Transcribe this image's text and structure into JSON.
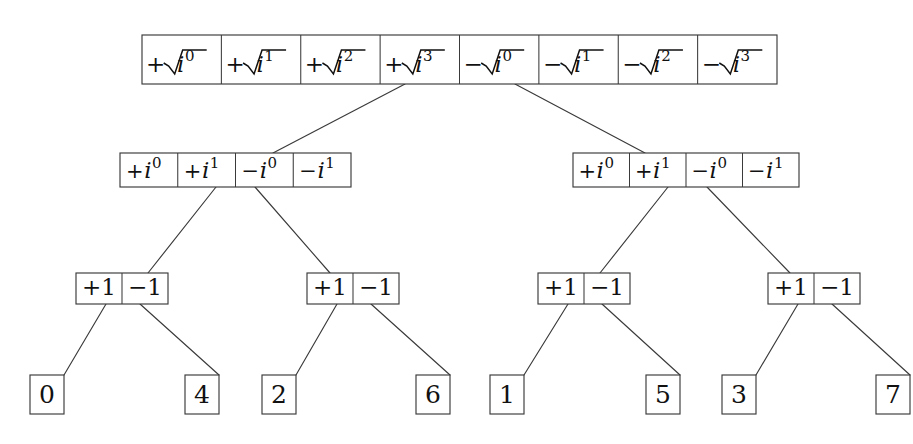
{
  "diagram": {
    "background_color": "#ffffff",
    "line_color": "#3a3a3a",
    "text_color": "#111111",
    "levels": [
      {
        "level": 0,
        "name": "root-row",
        "box": {
          "x": 142,
          "y": 35,
          "width": 635,
          "height": 49
        },
        "cells": [
          {
            "sign": "+",
            "radical": true,
            "base": "i",
            "exponent": "0",
            "label": "+√i⁰"
          },
          {
            "sign": "+",
            "radical": true,
            "base": "i",
            "exponent": "1",
            "label": "+√i¹"
          },
          {
            "sign": "+",
            "radical": true,
            "base": "i",
            "exponent": "2",
            "label": "+√i²"
          },
          {
            "sign": "+",
            "radical": true,
            "base": "i",
            "exponent": "3",
            "label": "+√i³"
          },
          {
            "sign": "−",
            "radical": true,
            "base": "i",
            "exponent": "0",
            "label": "−√i⁰"
          },
          {
            "sign": "−",
            "radical": true,
            "base": "i",
            "exponent": "1",
            "label": "−√i¹"
          },
          {
            "sign": "−",
            "radical": true,
            "base": "i",
            "exponent": "2",
            "label": "−√i²"
          },
          {
            "sign": "−",
            "radical": true,
            "base": "i",
            "exponent": "3",
            "label": "−√i³"
          }
        ]
      },
      {
        "level": 1,
        "name": "second-row",
        "boxes": [
          {
            "id": "left",
            "box": {
              "x": 120,
              "y": 153,
              "width": 231,
              "height": 34
            },
            "cells": [
              {
                "sign": "+",
                "radical": false,
                "base": "i",
                "exponent": "0",
                "label": "+i⁰"
              },
              {
                "sign": "+",
                "radical": false,
                "base": "i",
                "exponent": "1",
                "label": "+i¹"
              },
              {
                "sign": "−",
                "radical": false,
                "base": "i",
                "exponent": "0",
                "label": "−i⁰"
              },
              {
                "sign": "−",
                "radical": false,
                "base": "i",
                "exponent": "1",
                "label": "−i¹"
              }
            ]
          },
          {
            "id": "right",
            "box": {
              "x": 573,
              "y": 153,
              "width": 226,
              "height": 34
            },
            "cells": [
              {
                "sign": "+",
                "radical": false,
                "base": "i",
                "exponent": "0",
                "label": "+i⁰"
              },
              {
                "sign": "+",
                "radical": false,
                "base": "i",
                "exponent": "1",
                "label": "+i¹"
              },
              {
                "sign": "−",
                "radical": false,
                "base": "i",
                "exponent": "0",
                "label": "−i⁰"
              },
              {
                "sign": "−",
                "radical": false,
                "base": "i",
                "exponent": "1",
                "label": "−i¹"
              }
            ]
          }
        ]
      },
      {
        "level": 2,
        "name": "third-row",
        "boxes": [
          {
            "id": "a",
            "box": {
              "x": 76,
              "y": 273,
              "width": 92,
              "height": 31
            },
            "cells": [
              {
                "label": "+1"
              },
              {
                "label": "−1"
              }
            ]
          },
          {
            "id": "b",
            "box": {
              "x": 307,
              "y": 273,
              "width": 92,
              "height": 31
            },
            "cells": [
              {
                "label": "+1"
              },
              {
                "label": "−1"
              }
            ]
          },
          {
            "id": "c",
            "box": {
              "x": 538,
              "y": 273,
              "width": 92,
              "height": 31
            },
            "cells": [
              {
                "label": "+1"
              },
              {
                "label": "−1"
              }
            ]
          },
          {
            "id": "d",
            "box": {
              "x": 768,
              "y": 273,
              "width": 92,
              "height": 31
            },
            "cells": [
              {
                "label": "+1"
              },
              {
                "label": "−1"
              }
            ]
          }
        ]
      },
      {
        "level": 3,
        "name": "leaf-row",
        "leaves": [
          {
            "label": "0",
            "box": {
              "x": 30,
              "y": 375,
              "width": 34,
              "height": 39
            }
          },
          {
            "label": "4",
            "box": {
              "x": 185,
              "y": 375,
              "width": 34,
              "height": 39
            }
          },
          {
            "label": "2",
            "box": {
              "x": 262,
              "y": 375,
              "width": 34,
              "height": 39
            }
          },
          {
            "label": "6",
            "box": {
              "x": 416,
              "y": 375,
              "width": 34,
              "height": 39
            }
          },
          {
            "label": "1",
            "box": {
              "x": 490,
              "y": 375,
              "width": 34,
              "height": 39
            }
          },
          {
            "label": "5",
            "box": {
              "x": 646,
              "y": 375,
              "width": 34,
              "height": 39
            }
          },
          {
            "label": "3",
            "box": {
              "x": 722,
              "y": 375,
              "width": 34,
              "height": 39
            }
          },
          {
            "label": "7",
            "box": {
              "x": 876,
              "y": 375,
              "width": 34,
              "height": 39
            }
          }
        ]
      }
    ],
    "edges": [
      {
        "from": "root",
        "to": "second-left",
        "x1": 405,
        "y1": 84,
        "x2": 273,
        "y2": 153
      },
      {
        "from": "root",
        "to": "second-right",
        "x1": 515,
        "y1": 84,
        "x2": 645,
        "y2": 153
      },
      {
        "from": "second-left",
        "to": "third-a",
        "x1": 216,
        "y1": 187,
        "x2": 148,
        "y2": 273
      },
      {
        "from": "second-left",
        "to": "third-b",
        "x1": 255,
        "y1": 187,
        "x2": 330,
        "y2": 273
      },
      {
        "from": "second-right",
        "to": "third-c",
        "x1": 668,
        "y1": 187,
        "x2": 600,
        "y2": 273
      },
      {
        "from": "second-right",
        "to": "third-d",
        "x1": 707,
        "y1": 187,
        "x2": 790,
        "y2": 273
      },
      {
        "from": "third-a",
        "to": "leaf-0",
        "x1": 106,
        "y1": 304,
        "x2": 64,
        "y2": 375
      },
      {
        "from": "third-a",
        "to": "leaf-4",
        "x1": 140,
        "y1": 304,
        "x2": 219,
        "y2": 375
      },
      {
        "from": "third-b",
        "to": "leaf-2",
        "x1": 337,
        "y1": 304,
        "x2": 296,
        "y2": 375
      },
      {
        "from": "third-b",
        "to": "leaf-6",
        "x1": 371,
        "y1": 304,
        "x2": 450,
        "y2": 375
      },
      {
        "from": "third-c",
        "to": "leaf-1",
        "x1": 568,
        "y1": 304,
        "x2": 524,
        "y2": 375
      },
      {
        "from": "third-c",
        "to": "leaf-5",
        "x1": 602,
        "y1": 304,
        "x2": 680,
        "y2": 375
      },
      {
        "from": "third-d",
        "to": "leaf-3",
        "x1": 798,
        "y1": 304,
        "x2": 756,
        "y2": 375
      },
      {
        "from": "third-d",
        "to": "leaf-7",
        "x1": 832,
        "y1": 304,
        "x2": 910,
        "y2": 375
      }
    ]
  }
}
